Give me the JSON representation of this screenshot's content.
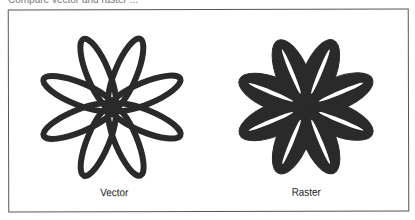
{
  "caption": "Compare vector and raster ...",
  "panels": [
    {
      "id": "vector",
      "label": "Vector",
      "style": "outline"
    },
    {
      "id": "raster",
      "label": "Raster",
      "style": "filled"
    }
  ],
  "colors": {
    "ink": "#2a2a2a",
    "frame": "#555555",
    "background": "#ffffff"
  }
}
